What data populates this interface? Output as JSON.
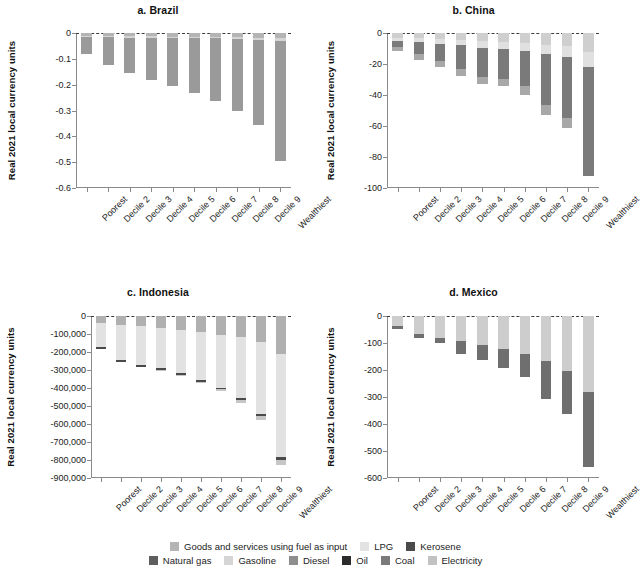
{
  "figure": {
    "ylabel": "Real 2021 local currency units",
    "categories": [
      "Poorest",
      "Decile 2",
      "Decile 3",
      "Decile 4",
      "Decile 5",
      "Decile 6",
      "Decile 7",
      "Decile 8",
      "Decile 9",
      "Wealthiest"
    ]
  },
  "legend": {
    "row1": [
      {
        "label": "Goods and services using fuel as input",
        "color": "#b4b4b4"
      },
      {
        "label": "LPG",
        "color": "#e2e2e2"
      },
      {
        "label": "Kerosene",
        "color": "#4a4a4a"
      }
    ],
    "row2": [
      {
        "label": "Natural gas",
        "color": "#5e5e5e"
      },
      {
        "label": "Gasoline",
        "color": "#d5d5d5"
      },
      {
        "label": "Diesel",
        "color": "#8e8e8e"
      },
      {
        "label": "Oil",
        "color": "#2b2b2b"
      },
      {
        "label": "Coal",
        "color": "#7a7a7a"
      },
      {
        "label": "Electricity",
        "color": "#c2c2c2"
      }
    ]
  },
  "chart_data": [
    {
      "type": "bar",
      "id": "brazil",
      "title": "a. Brazil",
      "xlabel": "",
      "ylabel": "Real 2021 local currency units",
      "ylim": [
        -0.6,
        0
      ],
      "yticks": [
        0,
        -0.1,
        -0.2,
        -0.3,
        -0.4,
        -0.5,
        -0.6
      ],
      "ytick_labels": [
        "0",
        "-0.1",
        "-0.2",
        "-0.3",
        "-0.4",
        "-0.5",
        "-0.6"
      ],
      "grid": false,
      "stacked": true,
      "categories": [
        "Poorest",
        "Decile 2",
        "Decile 3",
        "Decile 4",
        "Decile 5",
        "Decile 6",
        "Decile 7",
        "Decile 8",
        "Decile 9",
        "Wealthiest"
      ],
      "series": [
        {
          "name": "Goods and services using fuel as input",
          "color": "#b4b4b4",
          "values": [
            -0.012,
            -0.012,
            -0.013,
            -0.013,
            -0.014,
            -0.014,
            -0.015,
            -0.016,
            -0.018,
            -0.02
          ]
        },
        {
          "name": "Gasoline",
          "color": "#d5d5d5",
          "values": [
            -0.004,
            -0.004,
            -0.005,
            -0.005,
            -0.005,
            -0.006,
            -0.006,
            -0.007,
            -0.008,
            -0.01
          ]
        },
        {
          "name": "Diesel",
          "color": "#9a9a9a",
          "values": [
            -0.066,
            -0.108,
            -0.136,
            -0.164,
            -0.186,
            -0.212,
            -0.243,
            -0.279,
            -0.33,
            -0.465
          ]
        }
      ],
      "totals": [
        -0.082,
        -0.124,
        -0.154,
        -0.182,
        -0.205,
        -0.232,
        -0.264,
        -0.302,
        -0.356,
        -0.495
      ]
    },
    {
      "type": "bar",
      "id": "china",
      "title": "b. China",
      "xlabel": "",
      "ylabel": "Real 2021 local currency units",
      "ylim": [
        -100,
        0
      ],
      "yticks": [
        0,
        -20,
        -40,
        -60,
        -80,
        -100
      ],
      "ytick_labels": [
        "0",
        "-20",
        "-40",
        "-60",
        "-80",
        "-100"
      ],
      "grid": false,
      "stacked": true,
      "categories": [
        "Poorest",
        "Decile 2",
        "Decile 3",
        "Decile 4",
        "Decile 5",
        "Decile 6",
        "Decile 7",
        "Decile 8",
        "Decile 9",
        "Wealthiest"
      ],
      "series": [
        {
          "name": "Goods and services using fuel as input",
          "color": "#cfcfcf",
          "values": [
            -3.0,
            -3.4,
            -4.0,
            -4.5,
            -5.4,
            -5.8,
            -6.5,
            -7.6,
            -8.6,
            -12.0
          ]
        },
        {
          "name": "Electricity",
          "color": "#e0e0e0",
          "values": [
            -2.0,
            -2.4,
            -3.0,
            -3.5,
            -4.2,
            -4.6,
            -5.2,
            -6.0,
            -7.0,
            -10.0
          ]
        },
        {
          "name": "Coal",
          "color": "#7a7a7a",
          "values": [
            -4.0,
            -8.0,
            -11.0,
            -15.0,
            -19.0,
            -19.0,
            -22.5,
            -33.0,
            -39.0,
            -70.0
          ]
        },
        {
          "name": "Natural gas",
          "color": "#a8a8a8",
          "values": [
            -2.5,
            -3.5,
            -4.0,
            -4.5,
            -4.5,
            -4.5,
            -6.0,
            -6.0,
            -7.0,
            0.0
          ]
        }
      ],
      "totals": [
        -11.5,
        -17.3,
        -22.0,
        -27.5,
        -33.1,
        -33.9,
        -40.2,
        -52.6,
        -61.6,
        -92.0
      ]
    },
    {
      "type": "bar",
      "id": "indonesia",
      "title": "c. Indonesia",
      "xlabel": "",
      "ylabel": "Real 2021 local currency units",
      "ylim": [
        -900000,
        0
      ],
      "yticks": [
        0,
        -100000,
        -200000,
        -300000,
        -400000,
        -500000,
        -600000,
        -700000,
        -800000,
        -900000
      ],
      "ytick_labels": [
        "0",
        "-100,000",
        "-200,000",
        "-300,000",
        "-400,000",
        "-500,000",
        "-600,000",
        "-700,000",
        "-800,000",
        "-900,000"
      ],
      "grid": false,
      "stacked": true,
      "categories": [
        "Poorest",
        "Decile 2",
        "Decile 3",
        "Decile 4",
        "Decile 5",
        "Decile 6",
        "Decile 7",
        "Decile 8",
        "Decile 9",
        "Wealthiest"
      ],
      "series": [
        {
          "name": "Goods and services using fuel as input",
          "color": "#b0b0b0",
          "values": [
            -38000,
            -48000,
            -56000,
            -64000,
            -76000,
            -90000,
            -104000,
            -118000,
            -142000,
            -212000
          ]
        },
        {
          "name": "LPG",
          "color": "#e2e2e2",
          "values": [
            -134000,
            -196000,
            -218000,
            -224000,
            -240000,
            -266000,
            -294000,
            -340000,
            -400000,
            -570000
          ]
        },
        {
          "name": "Kerosene",
          "color": "#4a4a4a",
          "values": [
            -10000,
            -10000,
            -10000,
            -10000,
            -10000,
            -10000,
            -10000,
            -10000,
            -12000,
            -18000
          ]
        },
        {
          "name": "Gasoline",
          "color": "#c6c6c6",
          "values": [
            0,
            0,
            0,
            -2000,
            -4000,
            -4000,
            -6000,
            -16000,
            -26000,
            -30000
          ]
        }
      ],
      "totals": [
        -182000,
        -254000,
        -284000,
        -300000,
        -330000,
        -370000,
        -414000,
        -484000,
        -580000,
        -830000
      ]
    },
    {
      "type": "bar",
      "id": "mexico",
      "title": "d. Mexico",
      "xlabel": "",
      "ylabel": "Real 2021 local currency units",
      "ylim": [
        -600,
        0
      ],
      "yticks": [
        0,
        -100,
        -200,
        -300,
        -400,
        -500,
        -600
      ],
      "ytick_labels": [
        "0",
        "-100",
        "-200",
        "-300",
        "-400",
        "-500",
        "-600"
      ],
      "grid": false,
      "stacked": true,
      "categories": [
        "Poorest",
        "Decile 2",
        "Decile 3",
        "Decile 4",
        "Decile 5",
        "Decile 6",
        "Decile 7",
        "Decile 8",
        "Decile 9",
        "Wealthiest"
      ],
      "series": [
        {
          "name": "Goods and services using fuel as input",
          "color": "#cdcdcd",
          "values": [
            -38,
            -68,
            -80,
            -92,
            -106,
            -122,
            -140,
            -166,
            -202,
            -282
          ]
        },
        {
          "name": "Gasoline",
          "color": "#6f6f6f",
          "values": [
            -10,
            -12,
            -20,
            -48,
            -56,
            -72,
            -86,
            -140,
            -162,
            -278
          ]
        }
      ],
      "totals": [
        -48,
        -80,
        -100,
        -140,
        -162,
        -194,
        -226,
        -306,
        -364,
        -560
      ]
    }
  ]
}
